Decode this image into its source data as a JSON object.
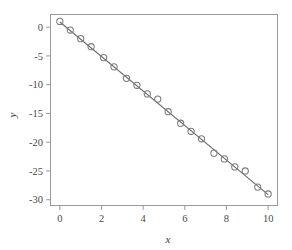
{
  "chart_data": {
    "type": "scatter",
    "title": "",
    "xlabel": "x",
    "ylabel": "y",
    "xlim": [
      -0.45,
      10.45
    ],
    "ylim": [
      -31.0,
      2.2
    ],
    "xticks": [
      0,
      2,
      4,
      6,
      8,
      10
    ],
    "xtick_labels": [
      "0",
      "2",
      "4",
      "6",
      "8",
      "10"
    ],
    "yticks": [
      0,
      -5,
      -10,
      -15,
      -20,
      -25,
      -30
    ],
    "ytick_labels": [
      "0",
      "-5",
      "-10",
      "-15",
      "-20",
      "-25",
      "-30"
    ],
    "grid": false,
    "legend": null,
    "marker": "open-circle",
    "marker_color": "#7a7a7a",
    "line_color": "#6b6b6b",
    "frame_color": "#9a9a9a",
    "background": "#ffffff",
    "series": [
      {
        "name": "observations",
        "type": "scatter",
        "x": [
          0.0,
          0.5,
          1.0,
          1.5,
          2.1,
          2.6,
          3.2,
          3.7,
          4.2,
          4.7,
          5.2,
          5.8,
          6.3,
          6.8,
          7.4,
          7.9,
          8.4,
          8.9,
          9.5,
          10.0
        ],
        "y": [
          1.0,
          -0.5,
          -2.0,
          -3.4,
          -5.3,
          -6.9,
          -8.9,
          -10.1,
          -11.6,
          -12.5,
          -14.7,
          -16.7,
          -18.1,
          -19.4,
          -21.9,
          -22.9,
          -24.3,
          -25.0,
          -27.8,
          -29.0
        ]
      },
      {
        "name": "fitted-line",
        "type": "line",
        "x": [
          0.0,
          10.0
        ],
        "y": [
          0.9,
          -29.1
        ]
      }
    ]
  },
  "axes": {
    "x_title": "x",
    "y_title": "y"
  }
}
